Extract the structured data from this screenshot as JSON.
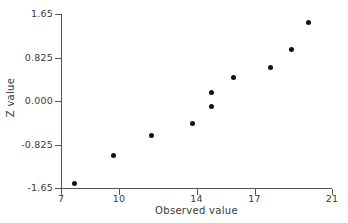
{
  "chart_data": {
    "type": "scatter",
    "title": "",
    "xlabel": "Observed value",
    "ylabel": "Z value",
    "xlim": [
      7,
      21
    ],
    "ylim": [
      -1.65,
      1.65
    ],
    "grid": false,
    "legend": null,
    "x_ticks": [
      "7",
      "10",
      "14",
      "17",
      "21"
    ],
    "x_tick_values": [
      7,
      10,
      14,
      17,
      21
    ],
    "y_ticks": [
      "1.65",
      "0.825",
      "0.000",
      "-0.825",
      "-1.65"
    ],
    "y_tick_values": [
      1.65,
      0.825,
      0.0,
      -0.825,
      -1.65
    ],
    "marker": "filled-circle",
    "marker_color": "#111111",
    "axis_color": "#555555",
    "text_color": "#3a3a3a",
    "background": "#ffffff",
    "points": [
      {
        "x": 7.7,
        "y": -1.56
      },
      {
        "x": 9.7,
        "y": -1.04
      },
      {
        "x": 11.7,
        "y": -0.66
      },
      {
        "x": 13.8,
        "y": -0.43
      },
      {
        "x": 14.8,
        "y": 0.16
      },
      {
        "x": 14.8,
        "y": -0.11
      },
      {
        "x": 15.9,
        "y": 0.44
      },
      {
        "x": 17.8,
        "y": 0.63
      },
      {
        "x": 18.9,
        "y": 0.97
      },
      {
        "x": 19.8,
        "y": 1.49
      }
    ],
    "x": [
      7.7,
      9.7,
      11.7,
      13.8,
      14.8,
      14.8,
      15.9,
      17.8,
      18.9,
      19.8
    ],
    "values": [
      -1.56,
      -1.04,
      -0.66,
      -0.43,
      0.16,
      -0.11,
      0.44,
      0.63,
      0.97,
      1.49
    ]
  }
}
